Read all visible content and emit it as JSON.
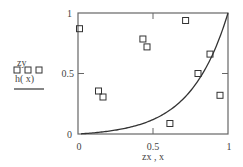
{
  "chart_data": {
    "type": "scatter",
    "title": "",
    "xlabel": "zx, x",
    "ylabel": "",
    "xlim": [
      0,
      1
    ],
    "ylim": [
      0,
      1
    ],
    "grid": false,
    "legend_position": "left",
    "x_ticks": [
      "0",
      "0.5",
      "1"
    ],
    "y_ticks": [
      "0",
      "0.5",
      "1"
    ],
    "series": [
      {
        "name": "zy",
        "kind": "scatter",
        "marker": "open-square",
        "x": [
          0.01,
          0.137,
          0.167,
          0.433,
          0.46,
          0.717,
          0.88,
          0.8,
          0.947,
          0.613
        ],
        "y": [
          0.87,
          0.355,
          0.306,
          0.785,
          0.72,
          0.938,
          0.66,
          0.5,
          0.32,
          0.087
        ]
      },
      {
        "name": "h(x)",
        "kind": "line",
        "x": [
          0.0,
          0.1,
          0.2,
          0.3,
          0.4,
          0.5,
          0.6,
          0.7,
          0.8,
          0.9,
          1.0
        ],
        "y": [
          0.0,
          0.009,
          0.022,
          0.045,
          0.076,
          0.119,
          0.184,
          0.276,
          0.44,
          0.66,
          1.0
        ]
      }
    ]
  },
  "legend": {
    "series1_label": "zy",
    "series1_marker": "□ □ □",
    "series2_label": "h( x)"
  },
  "axes": {
    "x_label": "zx , x",
    "x_tick_0": "0",
    "x_tick_mid": "0.5",
    "x_tick_1": "1",
    "y_tick_0": "0",
    "y_tick_mid": "0.5",
    "y_tick_1": "1"
  },
  "colors": {
    "axis": "#555555",
    "line": "#333333",
    "marker": "#333333"
  }
}
